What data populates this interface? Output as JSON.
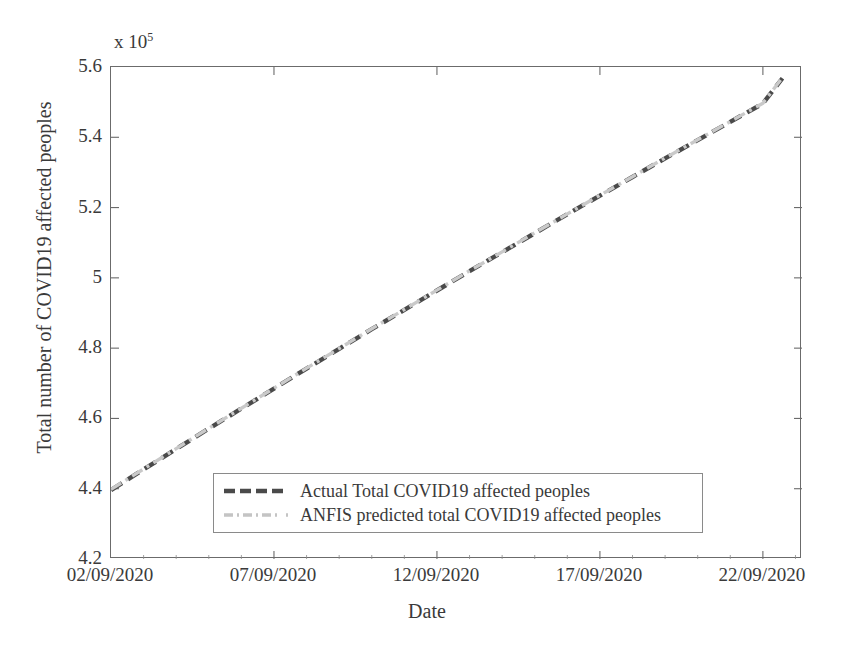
{
  "chart_data": {
    "type": "line",
    "title": "",
    "xlabel": "Date",
    "ylabel": "Total number of COVID19 affected peoples",
    "y_exponent_label": "x 10",
    "y_exponent_power": "5",
    "y_scale_factor": 100000,
    "grid": false,
    "legend_position": "lower center",
    "xlim": [
      0,
      21.2
    ],
    "ylim": [
      4.2,
      5.6
    ],
    "x_tick_labels": [
      "02/09/2020",
      "07/09/2020",
      "12/09/2020",
      "17/09/2020",
      "22/09/2020"
    ],
    "x_tick_values": [
      0,
      5,
      10,
      15,
      20
    ],
    "y_tick_labels": [
      "4.2",
      "4.4",
      "4.6",
      "4.8",
      "5",
      "5.2",
      "5.4",
      "5.6"
    ],
    "y_tick_values": [
      4.2,
      4.4,
      4.6,
      4.8,
      5.0,
      5.2,
      5.4,
      5.6
    ],
    "x": [
      0,
      1,
      2,
      3,
      4,
      5,
      6,
      7,
      8,
      9,
      10,
      11,
      12,
      13,
      14,
      15,
      16,
      17,
      18,
      19,
      20,
      20.6
    ],
    "series": [
      {
        "name": "Actual Total COVID19 affected peoples",
        "color": "#4a4a4a",
        "style": "dashed",
        "values": [
          4.396,
          4.455,
          4.513,
          4.571,
          4.628,
          4.685,
          4.742,
          4.798,
          4.854,
          4.909,
          4.964,
          5.019,
          5.073,
          5.127,
          5.181,
          5.234,
          5.287,
          5.34,
          5.392,
          5.444,
          5.496,
          5.568
        ]
      },
      {
        "name": "ANFIS predicted total COVID19 affected peoples",
        "color": "#c9c9c9",
        "style": "dash-dot",
        "values": [
          4.398,
          4.456,
          4.514,
          4.572,
          4.629,
          4.686,
          4.743,
          4.799,
          4.855,
          4.91,
          4.965,
          5.02,
          5.074,
          5.128,
          5.182,
          5.235,
          5.288,
          5.341,
          5.393,
          5.445,
          5.497,
          5.57
        ]
      }
    ]
  },
  "legend": {
    "entries": [
      {
        "label": "Actual Total COVID19 affected peoples"
      },
      {
        "label": "ANFIS predicted total COVID19 affected peoples"
      }
    ]
  },
  "colors": {
    "actual_line": "#4a4a4a",
    "predicted_line": "#c9c9c9",
    "axis": "#6b6b6b",
    "text": "#3a3a3a",
    "background": "#ffffff"
  }
}
